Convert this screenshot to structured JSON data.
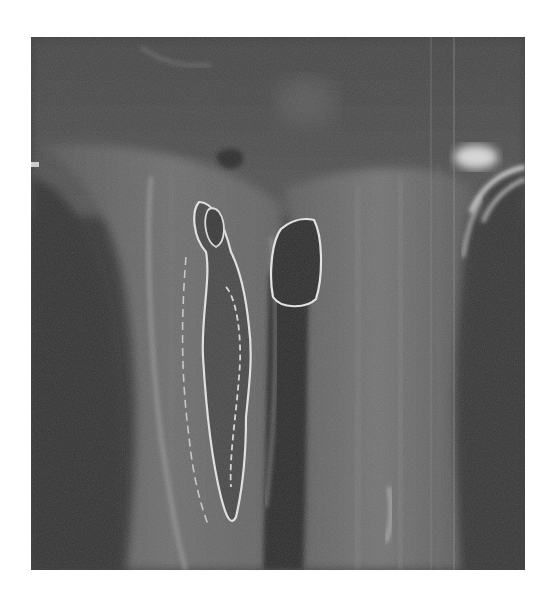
{
  "image": {
    "type": "grayscale medical scan",
    "description": "Coronal MRI-style slice of a lower limb near the knee showing a long bone with irregular bright cortical outlines, an oval lesion, and surrounding soft tissue",
    "frame": {
      "x": 31,
      "y": 37,
      "width": 494,
      "height": 533
    },
    "colors": {
      "page_background": "#ffffff",
      "scan_background": "#3a3a3a",
      "soft_tissue": "#6e6e6e",
      "bright_outline": "#e6e6e6",
      "dark_cavity": "#2c2c2c"
    }
  }
}
